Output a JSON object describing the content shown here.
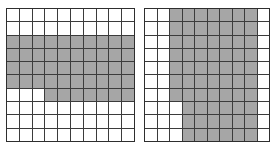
{
  "figure": {
    "background_color": "#ffffff",
    "grid_line_color": "#3b3b3b",
    "shaded_color": "#a6a6a6",
    "empty_color": "#ffffff",
    "rows": 10,
    "columns": 10
  },
  "grids": [
    {
      "id": "grid-left",
      "name": "left-grid",
      "rows": 10,
      "columns": 10,
      "shaded_count": 47,
      "shaded_fraction": "47/100",
      "description": "Horizontal band of shading spanning rows 3 through 6 fully, plus columns 4-10 of row 7",
      "cells": [
        [
          0,
          0,
          0,
          0,
          0,
          0,
          0,
          0,
          0,
          0
        ],
        [
          0,
          0,
          0,
          0,
          0,
          0,
          0,
          0,
          0,
          0
        ],
        [
          1,
          1,
          1,
          1,
          1,
          1,
          1,
          1,
          1,
          1
        ],
        [
          1,
          1,
          1,
          1,
          1,
          1,
          1,
          1,
          1,
          1
        ],
        [
          1,
          1,
          1,
          1,
          1,
          1,
          1,
          1,
          1,
          1
        ],
        [
          1,
          1,
          1,
          1,
          1,
          1,
          1,
          1,
          1,
          1
        ],
        [
          0,
          0,
          0,
          1,
          1,
          1,
          1,
          1,
          1,
          1
        ],
        [
          0,
          0,
          0,
          0,
          0,
          0,
          0,
          0,
          0,
          0
        ],
        [
          0,
          0,
          0,
          0,
          0,
          0,
          0,
          0,
          0,
          0
        ],
        [
          0,
          0,
          0,
          0,
          0,
          0,
          0,
          0,
          0,
          0
        ]
      ]
    },
    {
      "id": "grid-right",
      "name": "right-grid",
      "rows": 10,
      "columns": 10,
      "shaded_count": 67,
      "shaded_fraction": "67/100",
      "description": "Vertical band of shading spanning columns 3 through 9 in rows 1-7, narrowing to columns 4 through 9 in rows 8-10",
      "cells": [
        [
          0,
          0,
          1,
          1,
          1,
          1,
          1,
          1,
          1,
          0
        ],
        [
          0,
          0,
          1,
          1,
          1,
          1,
          1,
          1,
          1,
          0
        ],
        [
          0,
          0,
          1,
          1,
          1,
          1,
          1,
          1,
          1,
          0
        ],
        [
          0,
          0,
          1,
          1,
          1,
          1,
          1,
          1,
          1,
          0
        ],
        [
          0,
          0,
          1,
          1,
          1,
          1,
          1,
          1,
          1,
          0
        ],
        [
          0,
          0,
          1,
          1,
          1,
          1,
          1,
          1,
          1,
          0
        ],
        [
          0,
          0,
          1,
          1,
          1,
          1,
          1,
          1,
          1,
          0
        ],
        [
          0,
          0,
          0,
          1,
          1,
          1,
          1,
          1,
          1,
          0
        ],
        [
          0,
          0,
          0,
          1,
          1,
          1,
          1,
          1,
          1,
          0
        ],
        [
          0,
          0,
          0,
          1,
          1,
          1,
          1,
          1,
          1,
          0
        ]
      ]
    }
  ],
  "chart_data": {
    "type": "heatmap",
    "subtitle": "",
    "xlabel": "",
    "ylabel": "",
    "legend": [
      {
        "label": "shaded",
        "value": 1,
        "color": "#a6a6a6"
      },
      {
        "label": "empty",
        "value": 0,
        "color": "#ffffff"
      }
    ],
    "legend_position": "none",
    "grid": true,
    "panels": [
      {
        "name": "left-grid",
        "rows": 10,
        "columns": 10,
        "xlim": [
          0,
          10
        ],
        "ylim": [
          0,
          10
        ],
        "values": [
          [
            0,
            0,
            0,
            0,
            0,
            0,
            0,
            0,
            0,
            0
          ],
          [
            0,
            0,
            0,
            0,
            0,
            0,
            0,
            0,
            0,
            0
          ],
          [
            1,
            1,
            1,
            1,
            1,
            1,
            1,
            1,
            1,
            1
          ],
          [
            1,
            1,
            1,
            1,
            1,
            1,
            1,
            1,
            1,
            1
          ],
          [
            1,
            1,
            1,
            1,
            1,
            1,
            1,
            1,
            1,
            1
          ],
          [
            1,
            1,
            1,
            1,
            1,
            1,
            1,
            1,
            1,
            1
          ],
          [
            0,
            0,
            0,
            1,
            1,
            1,
            1,
            1,
            1,
            1
          ],
          [
            0,
            0,
            0,
            0,
            0,
            0,
            0,
            0,
            0,
            0
          ],
          [
            0,
            0,
            0,
            0,
            0,
            0,
            0,
            0,
            0,
            0
          ],
          [
            0,
            0,
            0,
            0,
            0,
            0,
            0,
            0,
            0,
            0
          ]
        ],
        "shaded_count": 47
      },
      {
        "name": "right-grid",
        "rows": 10,
        "columns": 10,
        "xlim": [
          0,
          10
        ],
        "ylim": [
          0,
          10
        ],
        "values": [
          [
            0,
            0,
            1,
            1,
            1,
            1,
            1,
            1,
            1,
            0
          ],
          [
            0,
            0,
            1,
            1,
            1,
            1,
            1,
            1,
            1,
            0
          ],
          [
            0,
            0,
            1,
            1,
            1,
            1,
            1,
            1,
            1,
            0
          ],
          [
            0,
            0,
            1,
            1,
            1,
            1,
            1,
            1,
            1,
            0
          ],
          [
            0,
            0,
            1,
            1,
            1,
            1,
            1,
            1,
            1,
            0
          ],
          [
            0,
            0,
            1,
            1,
            1,
            1,
            1,
            1,
            1,
            0
          ],
          [
            0,
            0,
            1,
            1,
            1,
            1,
            1,
            1,
            1,
            0
          ],
          [
            0,
            0,
            0,
            1,
            1,
            1,
            1,
            1,
            1,
            0
          ],
          [
            0,
            0,
            0,
            1,
            1,
            1,
            1,
            1,
            1,
            0
          ],
          [
            0,
            0,
            0,
            1,
            1,
            1,
            1,
            1,
            1,
            0
          ]
        ],
        "shaded_count": 67
      }
    ]
  }
}
